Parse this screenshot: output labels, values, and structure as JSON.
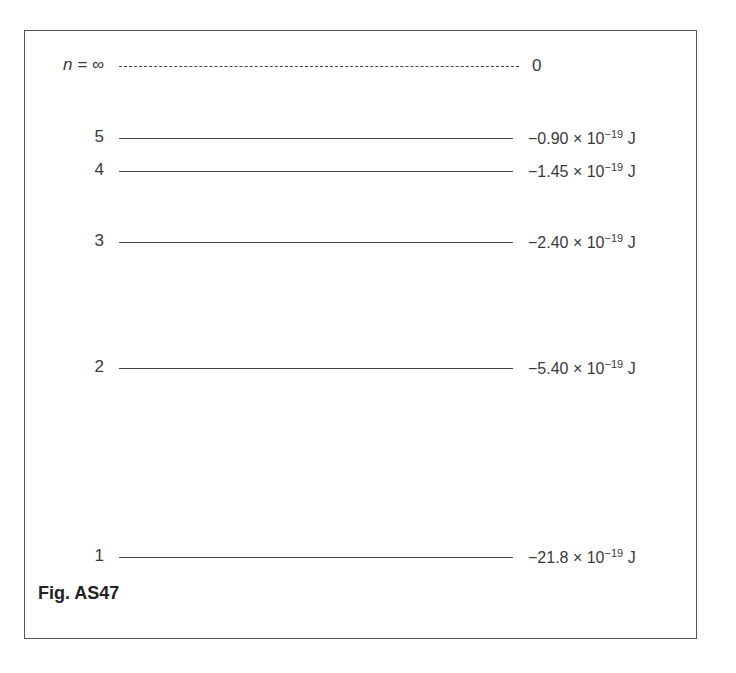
{
  "figure": {
    "caption": "Fig. AS47",
    "levels": [
      {
        "n": "n = ∞",
        "energy_mantissa": "0",
        "energy_exp": "",
        "energy_unit": "",
        "style": "dashed",
        "y": 66
      },
      {
        "n": "5",
        "energy_mantissa": "−0.90 × 10",
        "energy_exp": "−19",
        "energy_unit": " J",
        "style": "solid",
        "y": 138
      },
      {
        "n": "4",
        "energy_mantissa": "−1.45 × 10",
        "energy_exp": "−19",
        "energy_unit": " J",
        "style": "solid",
        "y": 171
      },
      {
        "n": "3",
        "energy_mantissa": "−2.40 × 10",
        "energy_exp": "−19",
        "energy_unit": " J",
        "style": "solid",
        "y": 242
      },
      {
        "n": "2",
        "energy_mantissa": "−5.40 × 10",
        "energy_exp": "−19",
        "energy_unit": " J",
        "style": "solid",
        "y": 368
      },
      {
        "n": "1",
        "energy_mantissa": "−21.8 × 10",
        "energy_exp": "−19",
        "energy_unit": " J",
        "style": "solid",
        "y": 557
      }
    ]
  }
}
